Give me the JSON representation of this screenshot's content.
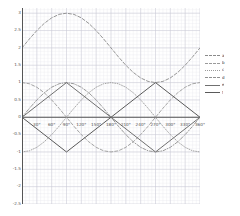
{
  "chart_data": {
    "type": "line",
    "title": "",
    "xlabel": "",
    "ylabel": "",
    "xlim": [
      0,
      360
    ],
    "ylim": [
      -2.5,
      3.15
    ],
    "grid": true,
    "grid_minor": true,
    "legend_position": "right",
    "x_unit": "degrees",
    "xticks": [
      0,
      30,
      60,
      90,
      120,
      150,
      180,
      210,
      240,
      270,
      300,
      330,
      360
    ],
    "xticklabels": [
      "0°",
      "30°",
      "60°",
      "90°",
      "120°",
      "150°",
      "180°",
      "210°",
      "240°",
      "270°",
      "300°",
      "330°",
      "360°"
    ],
    "yticks": [
      3,
      2.5,
      2,
      1.5,
      1,
      0.5,
      0,
      -0.5,
      -1,
      -1.5,
      -2,
      -2.5
    ],
    "yticklabels": [
      "3",
      "2.5",
      "2",
      "1.5",
      "1",
      "0.5",
      "0",
      "-0.5",
      "-1",
      "-1.5",
      "-2",
      "-2.5"
    ],
    "series": [
      {
        "name": "a",
        "style": "dashed",
        "color": "#8a8a8a",
        "width": 0.9,
        "formula": "2 + sin(x)",
        "x": [
          0,
          15,
          30,
          45,
          60,
          75,
          90,
          105,
          120,
          135,
          150,
          165,
          180,
          195,
          210,
          225,
          240,
          255,
          270,
          285,
          300,
          315,
          330,
          345,
          360
        ],
        "y": [
          2.0,
          2.259,
          2.5,
          2.707,
          2.866,
          2.966,
          3.0,
          2.966,
          2.866,
          2.707,
          2.5,
          2.259,
          2.0,
          1.741,
          1.5,
          1.293,
          1.134,
          1.034,
          1.0,
          1.034,
          1.134,
          1.293,
          1.5,
          1.741,
          2.0
        ]
      },
      {
        "name": "b",
        "style": "dashed",
        "color": "#9a9a9a",
        "width": 0.9,
        "formula": "cos(x)",
        "x": [
          0,
          15,
          30,
          45,
          60,
          75,
          90,
          105,
          120,
          135,
          150,
          165,
          180,
          195,
          210,
          225,
          240,
          255,
          270,
          285,
          300,
          315,
          330,
          345,
          360
        ],
        "y": [
          1.0,
          0.966,
          0.866,
          0.707,
          0.5,
          0.259,
          0.0,
          -0.259,
          -0.5,
          -0.707,
          -0.866,
          -0.966,
          -1.0,
          -0.966,
          -0.866,
          -0.707,
          -0.5,
          -0.259,
          0.0,
          0.259,
          0.5,
          0.707,
          0.866,
          0.966,
          1.0
        ]
      },
      {
        "name": "c",
        "style": "dotted",
        "color": "#9a9a9a",
        "width": 0.9,
        "formula": "-cos(x)",
        "x": [
          0,
          15,
          30,
          45,
          60,
          75,
          90,
          105,
          120,
          135,
          150,
          165,
          180,
          195,
          210,
          225,
          240,
          255,
          270,
          285,
          300,
          315,
          330,
          345,
          360
        ],
        "y": [
          -1.0,
          -0.966,
          -0.866,
          -0.707,
          -0.5,
          -0.259,
          0.0,
          0.259,
          0.5,
          0.707,
          0.866,
          0.966,
          1.0,
          0.966,
          0.866,
          0.707,
          0.5,
          0.259,
          0.0,
          -0.259,
          -0.5,
          -0.707,
          -0.866,
          -0.966,
          -1.0
        ]
      },
      {
        "name": "d",
        "style": "dashdot",
        "color": "#8f8f8f",
        "width": 0.9,
        "formula": "sin(x)",
        "x": [
          0,
          15,
          30,
          45,
          60,
          75,
          90,
          105,
          120,
          135,
          150,
          165,
          180,
          195,
          210,
          225,
          240,
          255,
          270,
          285,
          300,
          315,
          330,
          345,
          360
        ],
        "y": [
          0.0,
          0.259,
          0.5,
          0.707,
          0.866,
          0.966,
          1.0,
          0.966,
          0.866,
          0.707,
          0.5,
          0.259,
          0.0,
          -0.259,
          -0.5,
          -0.707,
          -0.866,
          -0.966,
          -1.0,
          -0.966,
          -0.866,
          -0.707,
          -0.5,
          -0.259,
          0.0
        ]
      },
      {
        "name": "e",
        "style": "solid",
        "color": "#707070",
        "width": 1.0,
        "formula": "triangle wave rising from 0",
        "x": [
          0,
          90,
          180,
          270,
          360
        ],
        "y": [
          0.0,
          1.0,
          0.0,
          -1.0,
          0.0
        ]
      },
      {
        "name": "f",
        "style": "solid",
        "color": "#5a5a5a",
        "width": 1.0,
        "formula": "triangle wave falling from 0",
        "x": [
          0,
          90,
          180,
          270,
          360
        ],
        "y": [
          0.0,
          -1.0,
          0.0,
          1.0,
          0.0
        ]
      }
    ]
  },
  "legend": {
    "entries": [
      {
        "label": "a",
        "style": "dashed",
        "color": "#8a8a8a"
      },
      {
        "label": "b",
        "style": "dashed",
        "color": "#9a9a9a"
      },
      {
        "label": "c",
        "style": "dotted",
        "color": "#9a9a9a"
      },
      {
        "label": "d",
        "style": "dashdot",
        "color": "#8f8f8f"
      },
      {
        "label": "e",
        "style": "solid",
        "color": "#707070"
      },
      {
        "label": "f",
        "style": "solid",
        "color": "#5a5a5a"
      }
    ]
  },
  "style": {
    "grid_minor_color": "#e9e9ef",
    "grid_major_color": "#c9c9d4",
    "axis_color": "#555555",
    "background": "#ffffff",
    "tick_label_color": "#555555"
  }
}
